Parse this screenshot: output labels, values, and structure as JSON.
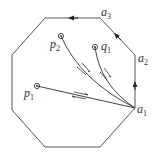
{
  "diagram": {
    "title": "",
    "octagon": {
      "vertices": [
        [
          45,
          18
        ],
        [
          100,
          18
        ],
        [
          135,
          55
        ],
        [
          135,
          108
        ],
        [
          100,
          147
        ],
        [
          45,
          147
        ],
        [
          12,
          110
        ],
        [
          12,
          55
        ]
      ],
      "stroke": "#555555"
    },
    "boundary_labels": [
      {
        "id": "a1",
        "base": "a",
        "sub": "1",
        "x": 137,
        "y": 113
      },
      {
        "id": "a2",
        "base": "a",
        "sub": "2",
        "x": 138,
        "y": 62
      },
      {
        "id": "a3",
        "base": "a",
        "sub": "3",
        "x": 101,
        "y": 16
      }
    ],
    "points": [
      {
        "id": "p1",
        "base": "p",
        "sub": "1",
        "cx": 37,
        "cy": 86,
        "lx": 24,
        "ly": 97
      },
      {
        "id": "p2",
        "base": "p",
        "sub": "2",
        "cx": 61,
        "cy": 36,
        "lx": 50,
        "ly": 48
      },
      {
        "id": "q1",
        "base": "q",
        "sub": "1",
        "cx": 95,
        "cy": 47,
        "lx": 101,
        "ly": 50
      }
    ],
    "edge_arrows": [
      {
        "on": "a1-a2",
        "direction": "up"
      },
      {
        "on": "a2-a3",
        "direction": "up-left"
      },
      {
        "on": "a3-top",
        "direction": "left"
      }
    ],
    "paths": [
      {
        "from": "a1",
        "to": "p1",
        "double_arrow": true
      },
      {
        "from": "a1",
        "to": "p2",
        "double_arrow": true
      },
      {
        "from": "a1",
        "to": "q1",
        "double_arrow": true
      }
    ]
  }
}
